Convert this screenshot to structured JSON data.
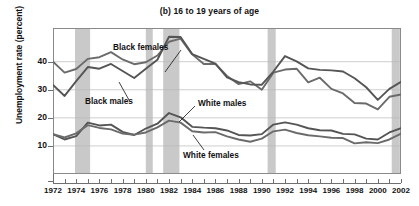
{
  "chart_data": {
    "type": "line",
    "title": "(b) 16 to 19 years of age",
    "xlabel": "",
    "ylabel": "Unemployment rate (percent)",
    "xlim": [
      1972,
      2002
    ],
    "ylim": [
      0,
      52
    ],
    "yticks": [
      10,
      20,
      30,
      40
    ],
    "xticks": [
      1972,
      1974,
      1976,
      1978,
      1980,
      1982,
      1984,
      1986,
      1988,
      1990,
      1992,
      1994,
      1996,
      1998,
      2000,
      2002
    ],
    "grid": true,
    "legend_position": "inline-annotations",
    "x": [
      1972,
      1973,
      1974,
      1975,
      1976,
      1977,
      1978,
      1979,
      1980,
      1981,
      1982,
      1983,
      1984,
      1985,
      1986,
      1987,
      1988,
      1989,
      1990,
      1991,
      1992,
      1993,
      1994,
      1995,
      1996,
      1997,
      1998,
      1999,
      2000,
      2001,
      2002
    ],
    "series": [
      {
        "name": "Black females",
        "color": "#6b6b6b",
        "values": [
          40.0,
          36.1,
          37.4,
          41.0,
          41.6,
          43.4,
          40.8,
          39.1,
          39.8,
          42.2,
          47.1,
          48.2,
          42.6,
          39.2,
          39.2,
          34.9,
          32.0,
          33.0,
          30.0,
          36.1,
          37.2,
          37.5,
          32.6,
          34.3,
          30.3,
          28.7,
          25.3,
          25.1,
          23.0,
          27.5,
          28.3
        ]
      },
      {
        "name": "Black males",
        "color": "#555555",
        "values": [
          31.7,
          27.8,
          33.1,
          38.1,
          37.5,
          39.2,
          36.7,
          34.2,
          37.5,
          40.7,
          48.9,
          48.8,
          42.7,
          41.0,
          39.3,
          34.4,
          32.7,
          31.9,
          31.8,
          36.5,
          42.0,
          40.1,
          37.6,
          37.1,
          36.9,
          36.5,
          34.1,
          30.9,
          26.4,
          30.3,
          32.8
        ]
      },
      {
        "name": "White males",
        "color": "#555555",
        "values": [
          14.2,
          12.3,
          13.5,
          18.3,
          17.3,
          17.6,
          15.0,
          13.9,
          16.2,
          17.9,
          21.7,
          20.2,
          16.8,
          16.5,
          16.3,
          15.5,
          13.9,
          13.7,
          14.2,
          17.6,
          18.4,
          17.6,
          16.3,
          15.6,
          15.5,
          14.3,
          14.1,
          12.6,
          12.3,
          14.8,
          16.3
        ]
      },
      {
        "name": "White females",
        "color": "#6b6b6b",
        "values": [
          14.2,
          13.0,
          14.5,
          17.4,
          16.4,
          15.9,
          14.4,
          14.0,
          14.8,
          16.6,
          19.0,
          18.3,
          15.2,
          14.8,
          14.9,
          13.4,
          12.3,
          11.5,
          12.6,
          15.2,
          15.8,
          14.6,
          13.8,
          13.4,
          12.9,
          12.8,
          10.9,
          11.3,
          11.0,
          12.3,
          14.4
        ]
      }
    ],
    "recession_bands": [
      {
        "start": 1973.9,
        "end": 1975.2
      },
      {
        "start": 1980.0,
        "end": 1980.6
      },
      {
        "start": 1981.5,
        "end": 1982.9
      },
      {
        "start": 1990.5,
        "end": 1991.2
      },
      {
        "start": 2001.2,
        "end": 2001.9
      }
    ],
    "band_color": "#c9c9c9"
  }
}
